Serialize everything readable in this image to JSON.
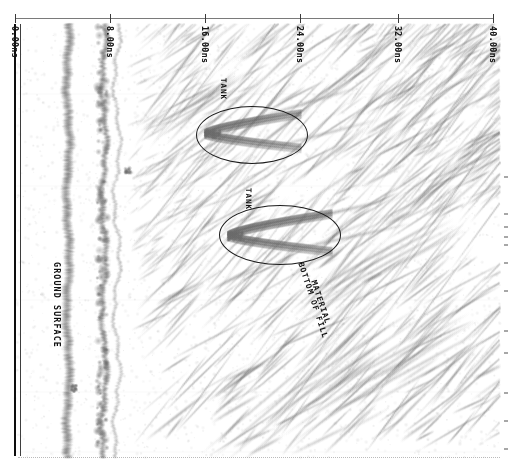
{
  "figure": {
    "kind": "ground-penetrating-radar-radargram",
    "background_color": "#ffffff",
    "trace_color": "#7d7d7d",
    "annotation_color": "#111111"
  },
  "time_axis": {
    "name": "two-way-travel-time",
    "unit": "ns",
    "orientation": "top",
    "range_ns": [
      0,
      40
    ],
    "ticks": [
      {
        "value_ns": 0,
        "label": "0.00ns",
        "x": 15
      },
      {
        "value_ns": 8,
        "label": "8.00ns",
        "x": 110
      },
      {
        "value_ns": 16,
        "label": "16.00ns",
        "x": 205
      },
      {
        "value_ns": 24,
        "label": "24.00ns",
        "x": 300
      },
      {
        "value_ns": 32,
        "label": "32.00ns",
        "x": 398
      },
      {
        "value_ns": 40,
        "label": "40.00ns",
        "x": 493
      }
    ]
  },
  "annotations": {
    "ground_surface": {
      "label": "GROUND SURFACE",
      "x": 62,
      "y": 262
    },
    "tank_upper": {
      "label": "TANK",
      "x": 228,
      "y": 78
    },
    "tank_lower": {
      "label": "TANK",
      "x": 253,
      "y": 188
    },
    "fill_bottom_line1": {
      "label": "BOTTOM OF FILL",
      "x": 305,
      "y": 261
    },
    "fill_bottom_line2": {
      "label": "MATERIAL",
      "x": 318,
      "y": 279
    }
  },
  "highlight_ellipses": [
    {
      "name": "tank-upper-ellipse",
      "left": 196,
      "top": 106,
      "width": 110,
      "height": 56
    },
    {
      "name": "tank-lower-ellipse",
      "left": 219,
      "top": 205,
      "width": 120,
      "height": 58
    }
  ],
  "chart_data": {
    "type": "heatmap",
    "title": "",
    "xlabel": "Two-way travel time (ns)",
    "ylabel": "Survey distance (traces)",
    "xlim": [
      0,
      40
    ],
    "grid": false,
    "legend": "none",
    "tick_labels": [
      "0.00ns",
      "8.00ns",
      "16.00ns",
      "24.00ns",
      "32.00ns",
      "40.00ns"
    ],
    "annotations": [
      "GROUND SURFACE",
      "TANK",
      "TANK",
      "BOTTOM OF FILL MATERIAL"
    ],
    "features": [
      {
        "name": "direct-wave-band",
        "time_ns": 0.2,
        "description": "dark vertical first-arrival rail at 0 ns"
      },
      {
        "name": "ground-surface-reflector",
        "time_ns": 3.9,
        "description": "strong continuous sub-vertical band"
      },
      {
        "name": "secondary-surface-multiple",
        "time_ns": 6.3,
        "description": "weaker parallel band"
      },
      {
        "name": "tank-hyperbola-upper",
        "time_ns": 17.5,
        "description": "hyperbolic diffraction from buried tank"
      },
      {
        "name": "tank-hyperbola-lower",
        "time_ns": 19.8,
        "description": "hyperbolic diffraction from buried tank"
      },
      {
        "name": "bottom-of-fill-reflector",
        "time_ns": 24.5,
        "description": "dipping reflector marking base of fill material"
      }
    ]
  }
}
